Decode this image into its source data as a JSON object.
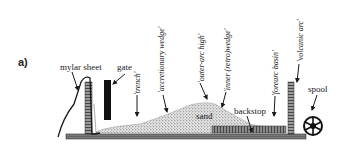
{
  "panel_label": "a)",
  "labels": {
    "mylar_sheet": "mylar sheet",
    "gate": "gate",
    "sand": "sand",
    "backstop": "backstop",
    "spool": "spool"
  },
  "annotations": [
    {
      "id": "trench",
      "text": "'trench'"
    },
    {
      "id": "accretionary_wedge",
      "text": "'accretionary wedge'"
    },
    {
      "id": "outer_arc_high",
      "text": "'outer-arc high'"
    },
    {
      "id": "inner_retro_wedge",
      "text": "'inner (retro)wedge'"
    },
    {
      "id": "forearc_basin",
      "text": "'forearc basin'"
    },
    {
      "id": "volcanic_arc",
      "text": "'volcanic arc'"
    }
  ],
  "colors": {
    "ink": "#1a1a1a",
    "base_plate": "#6e6e6e",
    "sand_fill": "#bdbdbd",
    "background": "#ffffff"
  }
}
